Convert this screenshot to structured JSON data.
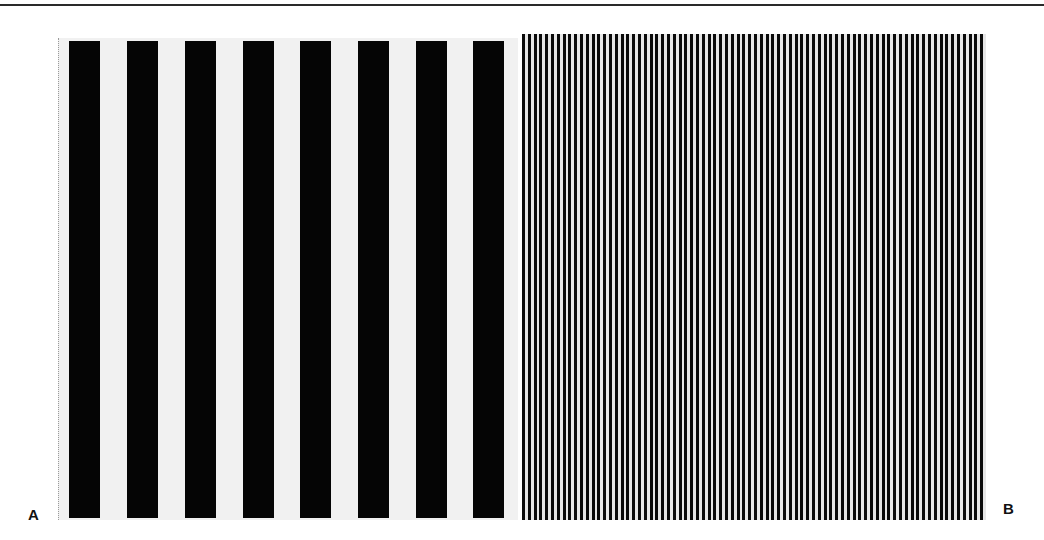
{
  "figure": {
    "panels": [
      {
        "label": "A",
        "description": "Low spatial frequency square-wave grating",
        "bar_count": 8,
        "bar_color": "#050505",
        "background_color": "#f1f1f1"
      },
      {
        "label": "B",
        "description": "High spatial frequency square-wave grating",
        "bar_color": "#0a0a0a",
        "background_color": "#e6e6e6"
      }
    ]
  }
}
